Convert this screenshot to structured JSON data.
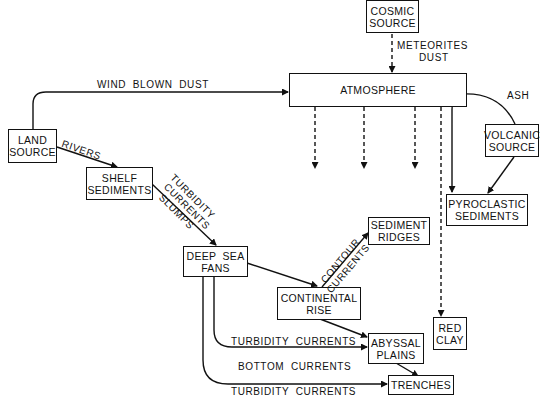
{
  "nodes": {
    "cosmic_source": {
      "line1": "COSMIC",
      "line2": "SOURCE"
    },
    "atmosphere": {
      "line1": "ATMOSPHERE"
    },
    "land_source": {
      "line1": "LAND",
      "line2": "SOURCE"
    },
    "shelf_sediments": {
      "line1": "SHELF",
      "line2": "SEDIMENTS"
    },
    "volcanic_source": {
      "line1": "VOLCANIC",
      "line2": "SOURCE"
    },
    "pyroclastic_sediments": {
      "line1": "PYROCLASTIC",
      "line2": "SEDIMENTS"
    },
    "deep_sea_fans": {
      "line1": "DEEP  SEA",
      "line2": "FANS"
    },
    "sediment_ridges": {
      "line1": "SEDIMENT",
      "line2": "RIDGES"
    },
    "continental_rise": {
      "line1": "CONTINENTAL",
      "line2": "RISE"
    },
    "abyssal_plains": {
      "line1": "ABYSSAL",
      "line2": "PLAINS"
    },
    "red_clay": {
      "line1": "RED",
      "line2": "CLAY"
    },
    "trenches": {
      "line1": "TRENCHES"
    }
  },
  "edges": {
    "meteorites": {
      "line1": "METEORITES",
      "line2": "DUST"
    },
    "wind_blown_dust": "WIND  BLOWN  DUST",
    "ash": "ASH",
    "rivers": "RIVERS",
    "turbidity_slumps": {
      "line1": "TURBIDITY",
      "line2": "CURRENTS",
      "line3": "SLUMPS"
    },
    "contour_currents": {
      "line1": "CONTOUR",
      "line2": "CURRENTS"
    },
    "turbidity_currents_1": "TURBIDITY  CURRENTS",
    "bottom_currents": "BOTTOM  CURRENTS",
    "turbidity_currents_2": "TURBIDITY  CURRENTS"
  }
}
